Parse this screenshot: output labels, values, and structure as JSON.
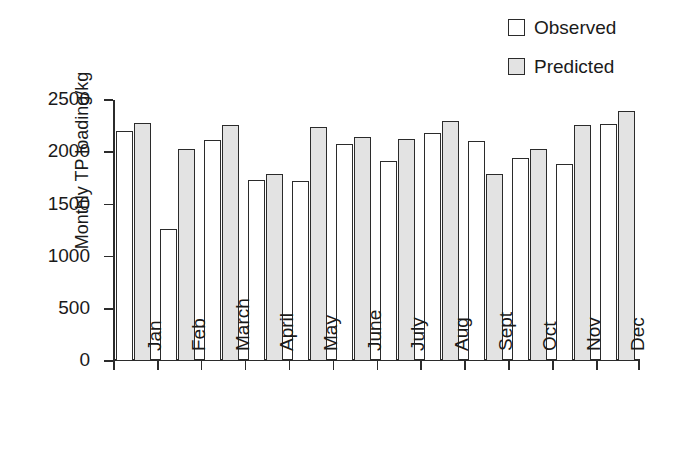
{
  "chart_data": {
    "type": "bar",
    "title": "",
    "xlabel": "",
    "ylabel": "Monthly TP loading/kg",
    "ylim": [
      0,
      2500
    ],
    "yticks": [
      0,
      500,
      1000,
      1500,
      2000,
      2500
    ],
    "ytick_labels": [
      "0",
      "500",
      "1000",
      "1500",
      "2000",
      "2500"
    ],
    "grid": false,
    "legend_position": "top-right",
    "categories": [
      "Jan",
      "Feb",
      "March",
      "April",
      "May",
      "June",
      "July",
      "Aug",
      "Sept",
      "Oct",
      "Nov",
      "Dec"
    ],
    "series": [
      {
        "name": "Observed",
        "color": "#ffffff",
        "edge_color": "#2b2b2b",
        "values": [
          2200,
          1260,
          2120,
          1730,
          1720,
          2075,
          1920,
          2180,
          2110,
          1945,
          1890,
          2275
        ]
      },
      {
        "name": "Predicted",
        "color": "#e3e3e3",
        "edge_color": "#2b2b2b",
        "values": [
          2280,
          2035,
          2260,
          1790,
          2240,
          2145,
          2130,
          2300,
          1790,
          2035,
          2260,
          2390
        ]
      }
    ]
  },
  "legend": {
    "items": [
      {
        "label": "Observed",
        "swatch": "legend-swatch-observed"
      },
      {
        "label": "Predicted",
        "swatch": "legend-swatch-predicted"
      }
    ]
  },
  "axes": {
    "y_title": "Monthly TP loading/kg"
  }
}
